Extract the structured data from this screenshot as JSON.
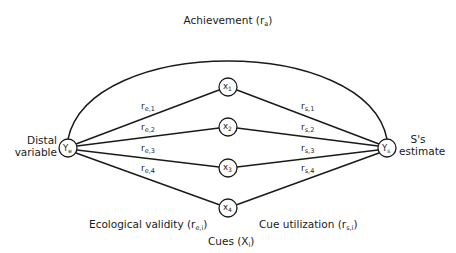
{
  "diagram": {
    "arc_label": {
      "main": "Achievement (r",
      "sub": "a",
      "close": ")"
    },
    "left_node": {
      "symbol": "Y",
      "sub": "e",
      "label_line1": "Distal",
      "label_line2": "variable"
    },
    "right_node": {
      "symbol": "Y",
      "sub": "s",
      "label_line1": "S's",
      "label_line2": "estimate"
    },
    "cues": [
      {
        "symbol": "x",
        "sub": "1"
      },
      {
        "symbol": "x",
        "sub": "2"
      },
      {
        "symbol": "x",
        "sub": "3"
      },
      {
        "symbol": "x",
        "sub": "4"
      }
    ],
    "ecological_edges": [
      {
        "symbol": "r",
        "sub": "e,1"
      },
      {
        "symbol": "r",
        "sub": "e,2"
      },
      {
        "symbol": "r",
        "sub": "e,3"
      },
      {
        "symbol": "r",
        "sub": "e,4"
      }
    ],
    "utilization_edges": [
      {
        "symbol": "r",
        "sub": "s,1"
      },
      {
        "symbol": "r",
        "sub": "s,2"
      },
      {
        "symbol": "r",
        "sub": "s,3"
      },
      {
        "symbol": "r",
        "sub": "s,4"
      }
    ],
    "bottom_labels": {
      "ecological": {
        "main": "Ecological validity (r",
        "sub": "e,i",
        "close": ")"
      },
      "utilization": {
        "main": "Cue utilization (r",
        "sub": "s,i",
        "close": ")"
      },
      "cues": {
        "main": "Cues (X",
        "sub": "i",
        "close": ")"
      }
    },
    "colors": {
      "ink": "#1a1a1a",
      "background": "#ffffff"
    }
  }
}
